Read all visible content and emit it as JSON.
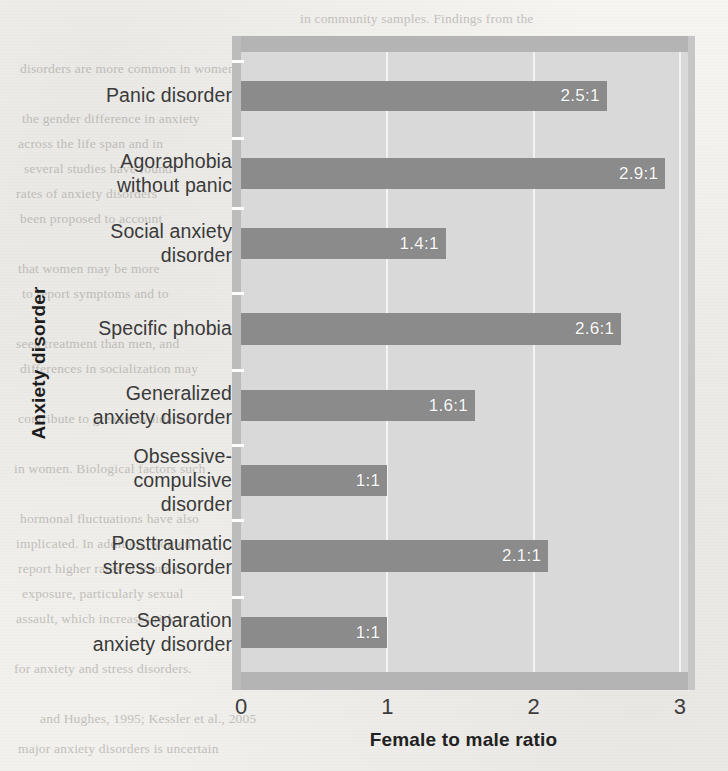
{
  "chart_data": {
    "type": "bar",
    "orientation": "horizontal",
    "title": "",
    "xlabel": "Female to male ratio",
    "ylabel": "Anxiety disorder",
    "xlim": [
      0,
      3
    ],
    "xticks": [
      "0",
      "1",
      "2",
      "3"
    ],
    "grid": true,
    "legend": "none",
    "categories": [
      "Panic disorder",
      "Agoraphobia without panic",
      "Social anxiety disorder",
      "Specific phobia",
      "Generalized anxiety disorder",
      "Obsessive-compulsive disorder",
      "Posttraumatic stress disorder",
      "Separation anxiety disorder"
    ],
    "category_lines": [
      [
        "Panic disorder"
      ],
      [
        "Agoraphobia",
        "without panic"
      ],
      [
        "Social anxiety",
        "disorder"
      ],
      [
        "Specific phobia"
      ],
      [
        "Generalized",
        "anxiety disorder"
      ],
      [
        "Obsessive-",
        "compulsive",
        "disorder"
      ],
      [
        "Posttraumatic",
        "stress disorder"
      ],
      [
        "Separation",
        "anxiety disorder"
      ]
    ],
    "values": [
      2.5,
      2.9,
      1.4,
      2.6,
      1.6,
      1.0,
      2.1,
      1.0
    ],
    "value_labels": [
      "2.5:1",
      "2.9:1",
      "1.4:1",
      "2.6:1",
      "1.6:1",
      "1:1",
      "2.1:1",
      "1:1"
    ]
  },
  "colors": {
    "bar_fill": "#8b8b8b",
    "plot_background": "#d9d9d9",
    "frame_band": "#b4b4b4",
    "gridline": "#f4f4f4",
    "value_label": "#fbfbfb",
    "page_background": "#f3f2ef",
    "axis_text": "#3a3a3a"
  },
  "background_text": {
    "lines": [
      "in community samples. Findings from the",
      "be more prevalent among women",
      "disorders are more common in women",
      "the gender difference in anxiety",
      "across the life span and in",
      "several studies have found",
      "rates of anxiety disorders",
      "been proposed to account",
      "that women may be more",
      "to report symptoms and to",
      "seek treatment than men, and",
      "differences in socialization may",
      "contribute to greater avoidance",
      "in women. Biological factors such",
      "hormonal fluctuations have also",
      "implicated. In addition, women",
      "report higher rates of trauma",
      "exposure, particularly sexual",
      "assault, which increases risk",
      "for anxiety and stress disorders.",
      "and Hughes, 1995; Kessler et al., 2005",
      "major anxiety disorders is uncertain"
    ]
  }
}
